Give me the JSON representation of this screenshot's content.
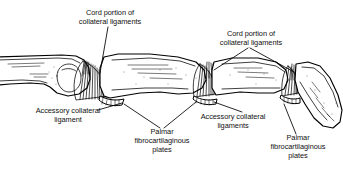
{
  "figure": {
    "background_color": "#ffffff",
    "ink_color": "#000000",
    "width": 343,
    "height": 170
  },
  "labels": {
    "cord_left": {
      "line1": "Cord portion of",
      "line2": "collateral ligaments"
    },
    "cord_right": {
      "line1": "Cord portion of",
      "line2": "collateral ligaments"
    },
    "accessory_left": {
      "line1": "Accessory collateral",
      "line2": "ligament"
    },
    "accessory_right": {
      "line1": "Accessory collateral",
      "line2": "ligaments"
    },
    "palmar_left": {
      "line1": "Palmar",
      "line2": "fibrocartilaginous",
      "line3": "plates"
    },
    "palmar_right": {
      "line1": "Palmar",
      "line2": "fibrocartilaginous",
      "line3": "plates"
    }
  },
  "structures": {
    "metacarpal": "metacarpal-bone",
    "proximal_phalanx": "proximal-phalanx-bone",
    "middle_phalanx": "middle-phalanx-bone",
    "distal_phalanx": "distal-phalanx-bone",
    "mcp_joint": "mcp-joint",
    "pip_joint": "pip-joint",
    "dip_joint": "dip-joint"
  }
}
